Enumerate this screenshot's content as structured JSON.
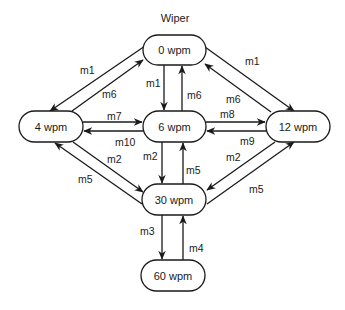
{
  "title": "Wiper",
  "nodes": [
    {
      "id": "n0",
      "label": "0 wpm",
      "x": 143,
      "y": 35,
      "w": 63,
      "h": 30
    },
    {
      "id": "n4",
      "label": "4 wpm",
      "x": 19,
      "y": 111,
      "w": 64,
      "h": 31
    },
    {
      "id": "n6",
      "label": "6 wpm",
      "x": 143,
      "y": 111,
      "w": 63,
      "h": 31
    },
    {
      "id": "n12",
      "label": "12 wpm",
      "x": 266,
      "y": 111,
      "w": 64,
      "h": 31
    },
    {
      "id": "n30",
      "label": "30 wpm",
      "x": 142,
      "y": 184,
      "w": 64,
      "h": 31
    },
    {
      "id": "n60",
      "label": "60 wpm",
      "x": 141,
      "y": 260,
      "w": 64,
      "h": 31
    }
  ],
  "edges": [
    {
      "from": "0 wpm",
      "to": "4 wpm",
      "label": "m1"
    },
    {
      "from": "4 wpm",
      "to": "0 wpm",
      "label": "m6"
    },
    {
      "from": "0 wpm",
      "to": "12 wpm",
      "label": "m1"
    },
    {
      "from": "12 wpm",
      "to": "0 wpm",
      "label": "m6"
    },
    {
      "from": "0 wpm",
      "to": "6 wpm",
      "label": "m1"
    },
    {
      "from": "6 wpm",
      "to": "0 wpm",
      "label": "m6"
    },
    {
      "from": "4 wpm",
      "to": "6 wpm",
      "label": "m7"
    },
    {
      "from": "6 wpm",
      "to": "4 wpm",
      "label": "m10"
    },
    {
      "from": "6 wpm",
      "to": "12 wpm",
      "label": "m8"
    },
    {
      "from": "12 wpm",
      "to": "6 wpm",
      "label": "m9"
    },
    {
      "from": "4 wpm",
      "to": "30 wpm",
      "label": "m2"
    },
    {
      "from": "30 wpm",
      "to": "4 wpm",
      "label": "m5"
    },
    {
      "from": "12 wpm",
      "to": "30 wpm",
      "label": "m2"
    },
    {
      "from": "30 wpm",
      "to": "12 wpm",
      "label": "m5"
    },
    {
      "from": "6 wpm",
      "to": "30 wpm",
      "label": "m2"
    },
    {
      "from": "30 wpm",
      "to": "6 wpm",
      "label": "m5"
    },
    {
      "from": "30 wpm",
      "to": "60 wpm",
      "label": "m3"
    },
    {
      "from": "60 wpm",
      "to": "30 wpm",
      "label": "m4"
    }
  ]
}
